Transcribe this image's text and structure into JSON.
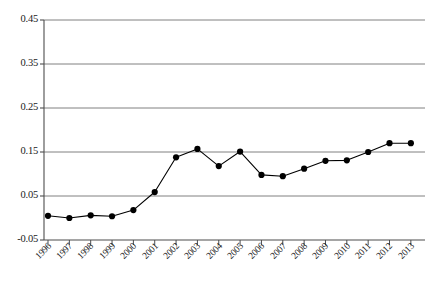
{
  "chart_data": {
    "type": "line",
    "title": "",
    "subtitle": "",
    "xlabel": "",
    "ylabel": "",
    "categories": [
      "1996",
      "1997",
      "1998",
      "1999",
      "2000",
      "2001",
      "2002",
      "2003",
      "2004",
      "2005",
      "2006",
      "2007",
      "2008",
      "2009",
      "2010",
      "2011",
      "2012",
      "2013"
    ],
    "values": [
      0.005,
      0.0,
      0.006,
      0.004,
      0.018,
      0.059,
      0.138,
      0.157,
      0.118,
      0.151,
      0.098,
      0.095,
      0.112,
      0.13,
      0.131,
      0.15,
      0.17,
      0.17
    ],
    "series": [
      {
        "name": "series-1",
        "values": [
          0.005,
          0.0,
          0.006,
          0.004,
          0.018,
          0.059,
          0.138,
          0.157,
          0.118,
          0.151,
          0.098,
          0.095,
          0.112,
          0.13,
          0.131,
          0.15,
          0.17,
          0.17
        ]
      }
    ],
    "ylim": [
      -0.05,
      0.45
    ],
    "xlim": [
      "1996",
      "2013"
    ],
    "ytick_labels": [
      "0.45",
      "0.35",
      "0.25",
      "0.15",
      "0.05",
      "-0.05"
    ],
    "ytick_values": [
      0.45,
      0.35,
      0.25,
      0.15,
      0.05,
      -0.05
    ],
    "grid": true,
    "grid_axis": "y",
    "legend": false,
    "legend_position": "none",
    "marker": "circle",
    "line_color": "#000000",
    "marker_color": "#000000",
    "grid_color": "#808080",
    "axis_color": "#4d4d4d",
    "background_color": "#ffffff",
    "annotations": []
  }
}
